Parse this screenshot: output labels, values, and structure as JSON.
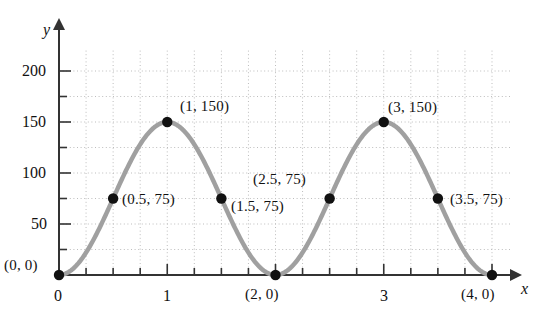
{
  "chart_data": {
    "type": "line",
    "title": "",
    "xlabel": "x",
    "ylabel": "y",
    "xlim": [
      0,
      4.25
    ],
    "ylim": [
      0,
      225
    ],
    "grid": true,
    "legend": null,
    "function": "y = 75 - 75*cos(pi*x)",
    "x_ticks_major": [
      0,
      1,
      2,
      3,
      4
    ],
    "x_tick_labels": [
      "0",
      "1",
      "",
      "3",
      ""
    ],
    "x_tick_minor_step": 0.25,
    "y_ticks_major": [
      50,
      100,
      150,
      200
    ],
    "y_tick_labels": [
      "50",
      "100",
      "150",
      "200"
    ],
    "y_tick_minor_step": 25,
    "grid_step_x": 0.25,
    "grid_step_y": 25,
    "series": [
      {
        "name": "curve",
        "color": "#a0a0a0",
        "x": [
          0,
          0.5,
          1,
          1.5,
          2,
          2.5,
          3,
          3.5,
          4
        ],
        "y": [
          0,
          75,
          150,
          75,
          0,
          75,
          150,
          75,
          0
        ]
      }
    ],
    "points": [
      {
        "x": 0,
        "y": 0,
        "label": "(0, 0)",
        "label_pos": "left-above"
      },
      {
        "x": 0.5,
        "y": 75,
        "label": "(0.5, 75)",
        "label_pos": "right"
      },
      {
        "x": 1,
        "y": 150,
        "label": "(1, 150)",
        "label_pos": "right-above"
      },
      {
        "x": 1.5,
        "y": 75,
        "label": "(1.5, 75)",
        "label_pos": "right"
      },
      {
        "x": 2.5,
        "y": 75,
        "label": "(2.5, 75)",
        "label_pos": "above"
      },
      {
        "x": 2,
        "y": 0,
        "label": "(2, 0)",
        "label_pos": "below"
      },
      {
        "x": 3,
        "y": 150,
        "label": "(3, 150)",
        "label_pos": "right-above"
      },
      {
        "x": 3.5,
        "y": 75,
        "label": "(3.5, 75)",
        "label_pos": "right"
      },
      {
        "x": 4,
        "y": 0,
        "label": "(4, 0)",
        "label_pos": "below"
      }
    ],
    "colors": {
      "curve": "#a0a0a0",
      "point": "#111111",
      "axis": "#333333",
      "grid": "#bdbdbd",
      "background": "#ffffff"
    }
  },
  "labels": {
    "y_axis_name": "y",
    "x_axis_name": "x",
    "y_200": "200",
    "y_150": "150",
    "y_100": "100",
    "y_50": "50",
    "x_0": "0",
    "x_1": "1",
    "x_3": "3",
    "p_0_0": "(0, 0)",
    "p_05_75": "(0.5, 75)",
    "p_1_150": "(1, 150)",
    "p_15_75": "(1.5, 75)",
    "p_2_0": "(2, 0)",
    "p_25_75": "(2.5, 75)",
    "p_3_150": "(3, 150)",
    "p_35_75": "(3.5, 75)",
    "p_4_0": "(4, 0)"
  }
}
